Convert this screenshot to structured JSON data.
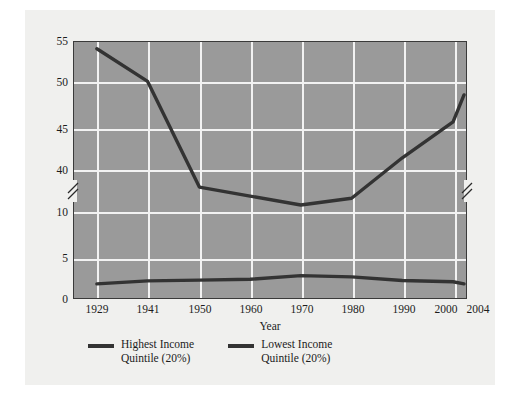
{
  "chart_data": {
    "type": "line",
    "title": "",
    "xlabel": "Year",
    "ylabel": "Percent of Total Family Income Received",
    "categories": [
      "1929",
      "1941",
      "1950",
      "1960",
      "1970",
      "1980",
      "1990",
      "2000",
      "2004"
    ],
    "x": [
      1929,
      1941,
      1950,
      1960,
      1970,
      1980,
      1990,
      2000,
      2004
    ],
    "series": [
      {
        "name": "Highest Income Quintile (20%)",
        "color": "#333333",
        "values": [
          54.4,
          51.5,
          42.1,
          41.3,
          40.5,
          41.1,
          44.7,
          47.9,
          50.3
        ]
      },
      {
        "name": "Lowest Income Quintile (20%)",
        "color": "#333333",
        "values": [
          3.5,
          4.2,
          4.4,
          4.6,
          5.5,
          5.2,
          4.3,
          4.0,
          3.5
        ]
      }
    ],
    "ylim": [
      0,
      55
    ],
    "y_ticks": [
      "55",
      "50",
      "45",
      "40",
      "10",
      "5",
      "0"
    ],
    "y_tick_values": [
      55,
      50,
      45,
      40,
      10,
      5,
      0
    ],
    "y_axis_break": {
      "present": true,
      "between": [
        40,
        10
      ],
      "note": "double-slash break mark on both left and right axes"
    },
    "x_ticks": [
      "1929",
      "1941",
      "1950",
      "1960",
      "1970",
      "1980",
      "1990",
      "2000",
      "2004"
    ],
    "grid": "both",
    "legend_position": "below-left",
    "plot_background": "#9a9a9a",
    "grid_color": "#f2f2f2",
    "frame_color": "#3a3a3a",
    "card_background": "#f0f0ee"
  },
  "axes": {
    "x_title": "Year",
    "y_title": "Percent of Total Family Income Received"
  },
  "legend": {
    "items": [
      {
        "line1": "Highest Income",
        "line2": "Quintile (20%)"
      },
      {
        "line1": "Lowest Income",
        "line2": "Quintile (20%)"
      }
    ]
  }
}
